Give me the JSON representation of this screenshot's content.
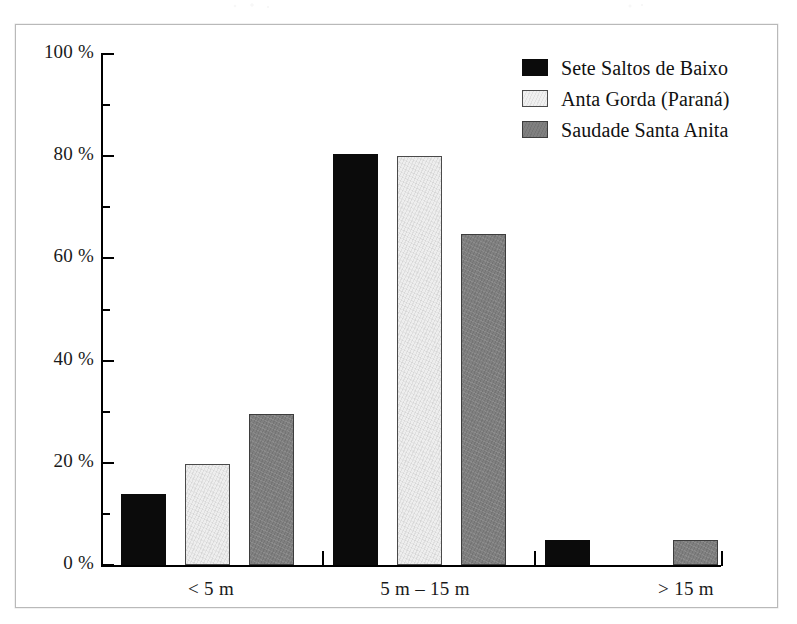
{
  "figure": {
    "frame_border_color": "#b9b9b9",
    "background_color": "#ffffff"
  },
  "legend": {
    "position": "top-right",
    "entries": [
      {
        "label": "Sete Saltos de Baixo",
        "swatch": "black-swatch-icon",
        "color": "#0b0b0b"
      },
      {
        "label": "Anta Gorda (Paraná)",
        "swatch": "light-swatch-icon",
        "color": "#eeeeee"
      },
      {
        "label": "Saudade Santa Anita",
        "swatch": "gray-swatch-icon",
        "color": "#808080"
      }
    ]
  },
  "axes": {
    "y_tick_labels": [
      "0 %",
      "20 %",
      "40 %",
      "60 %",
      "80 %",
      "100 %"
    ],
    "y_minor_tick_values": [
      10,
      30,
      50,
      70,
      90
    ],
    "x_tick_labels": [
      "< 5 m",
      "5 m – 15 m",
      "> 15 m"
    ]
  },
  "chart_data": {
    "type": "bar",
    "title": "",
    "xlabel": "",
    "ylabel": "",
    "categories": [
      "< 5 m",
      "5 m – 15 m",
      "> 15 m"
    ],
    "series": [
      {
        "name": "Sete Saltos de Baixo",
        "color": "#0b0b0b",
        "values": [
          13.8,
          80.5,
          4.9
        ]
      },
      {
        "name": "Anta Gorda (Paraná)",
        "color": "#eeeeee",
        "values": [
          19.7,
          80.0,
          0
        ]
      },
      {
        "name": "Saudade Santa Anita",
        "color": "#808080",
        "values": [
          29.6,
          64.8,
          4.9
        ]
      }
    ],
    "ylim": [
      0,
      100
    ],
    "yticks": [
      0,
      20,
      40,
      60,
      80,
      100
    ],
    "ytick_suffix": " %",
    "grid": false,
    "legend_position": "top right"
  }
}
